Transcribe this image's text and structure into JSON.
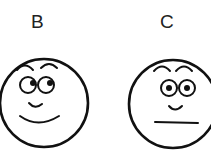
{
  "faces": [
    {
      "label": "B",
      "expression": "smiling",
      "mouth": "curved-smile",
      "eyes": "looking-sideways"
    },
    {
      "label": "C",
      "expression": "neutral",
      "mouth": "flat-line",
      "eyes": "looking-forward"
    }
  ]
}
